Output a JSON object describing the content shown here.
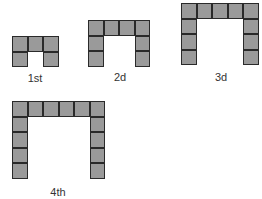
{
  "diagram": {
    "square_color": "#9a9a9a",
    "border_color": "#2a2a2a",
    "figures": [
      {
        "label": "1st",
        "width_squares": 3,
        "height_squares": 2,
        "total_squares": 5,
        "x": 12,
        "y": 36,
        "label_x": 35,
        "label_y": 72
      },
      {
        "label": "2d",
        "width_squares": 4,
        "height_squares": 3,
        "total_squares": 8,
        "x": 88,
        "y": 20,
        "label_x": 120,
        "label_y": 71
      },
      {
        "label": "3d",
        "width_squares": 5,
        "height_squares": 4,
        "total_squares": 11,
        "x": 181,
        "y": 3,
        "label_x": 221,
        "label_y": 71
      },
      {
        "label": "4th",
        "width_squares": 6,
        "height_squares": 5,
        "total_squares": 14,
        "x": 12,
        "y": 101,
        "label_x": 58,
        "label_y": 186
      }
    ]
  }
}
